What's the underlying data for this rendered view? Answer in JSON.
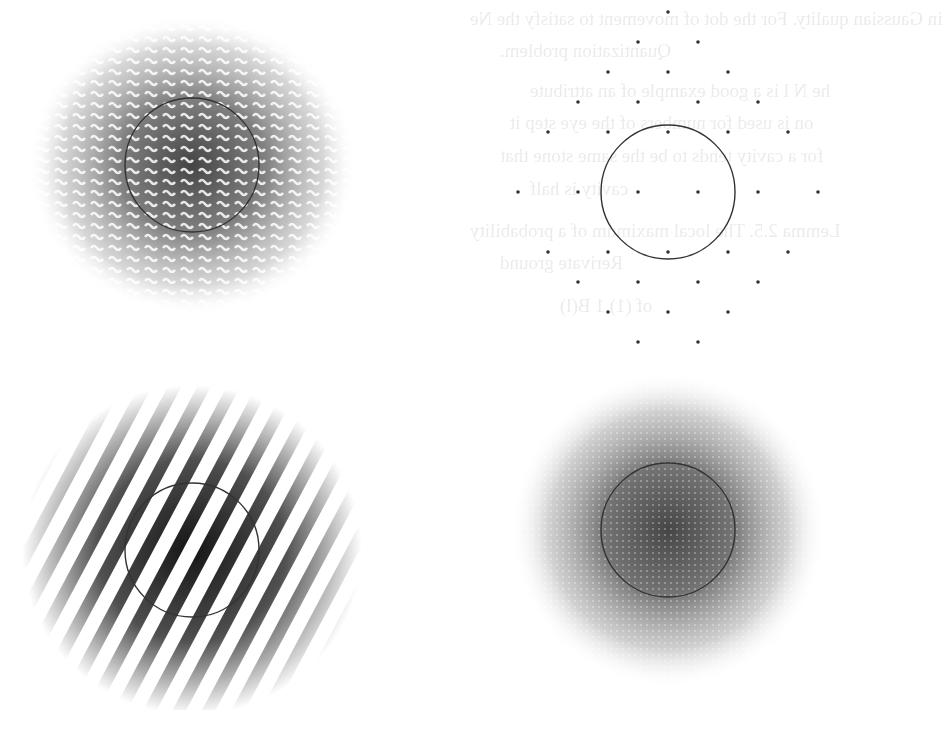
{
  "page": {
    "background": "#ffffff",
    "bleed_through_text": [
      {
        "text": "in Gaussian quality. For the dot of movement to satisfy the Ne",
        "x": 470,
        "y": 8
      },
      {
        "text": "Quantization problem.",
        "x": 500,
        "y": 40
      },
      {
        "text": "he N l is a good example of an attribute",
        "x": 530,
        "y": 80
      },
      {
        "text": "on is used for numbers of the eye step it",
        "x": 510,
        "y": 112
      },
      {
        "text": "for a cavity tends to be the same stone that",
        "x": 500,
        "y": 145
      },
      {
        "text": "cavity is half",
        "x": 530,
        "y": 178
      },
      {
        "text": "Lemma 2.5. The local maximum of a probability",
        "x": 470,
        "y": 220
      },
      {
        "text": "Rerivate ground",
        "x": 500,
        "y": 252
      },
      {
        "text": "of (1) 1 B(l)",
        "x": 560,
        "y": 295
      }
    ]
  },
  "chart_data": [
    {
      "type": "heatmap",
      "title": "",
      "panel": "top-left",
      "description": "Gaussian-envelope intensity pattern made of wavy (chevron) dot rows with horizontal banding; dark core",
      "center": [
        192,
        165
      ],
      "circle_radius": 67,
      "envelope_radius": 160,
      "texture": "wavy-rows",
      "peak_gray": "#3a3a3a",
      "edge_gray": "#c8c8c8"
    },
    {
      "type": "scatter",
      "title": "",
      "panel": "top-right",
      "description": "Hexagonal lattice of point dots with circle through the six nearest neighbours",
      "center": [
        668,
        192
      ],
      "circle_radius": 67,
      "lattice_dx": 60,
      "lattice_dy": 30,
      "points_relative": [
        [
          0,
          -6
        ],
        [
          -1,
          -5
        ],
        [
          1,
          -5
        ],
        [
          -2,
          -4
        ],
        [
          0,
          -4
        ],
        [
          2,
          -4
        ],
        [
          -3,
          -3
        ],
        [
          -1,
          -3
        ],
        [
          1,
          -3
        ],
        [
          3,
          -3
        ],
        [
          -4,
          -2
        ],
        [
          -2,
          -2
        ],
        [
          0,
          -2
        ],
        [
          2,
          -2
        ],
        [
          4,
          -2
        ],
        [
          -5,
          0
        ],
        [
          -3,
          0
        ],
        [
          -1,
          0
        ],
        [
          1,
          0
        ],
        [
          3,
          0
        ],
        [
          5,
          0
        ],
        [
          -4,
          2
        ],
        [
          -2,
          2
        ],
        [
          0,
          2
        ],
        [
          2,
          2
        ],
        [
          4,
          2
        ],
        [
          -3,
          3
        ],
        [
          -1,
          3
        ],
        [
          1,
          3
        ],
        [
          3,
          3
        ],
        [
          -2,
          4
        ],
        [
          0,
          4
        ],
        [
          2,
          4
        ],
        [
          -1,
          5
        ],
        [
          1,
          5
        ],
        [
          0,
          6
        ]
      ],
      "dot_color": "#333333"
    },
    {
      "type": "heatmap",
      "title": "",
      "panel": "bottom-left",
      "description": "Diagonal interference fringes inside a Gaussian envelope; dark stripes tilted about 60 degrees",
      "center": [
        192,
        550
      ],
      "circle_radius": 67,
      "envelope_radius": 165,
      "fringe_period": 26,
      "fringe_angle_deg": 62,
      "peak_gray": "#111111"
    },
    {
      "type": "heatmap",
      "title": "",
      "panel": "bottom-right",
      "description": "Speckled isotropic Gaussian blob with dark core",
      "center": [
        668,
        530
      ],
      "circle_radius": 67,
      "envelope_radius": 150,
      "texture": "speckle",
      "peak_gray": "#3c3c3c"
    }
  ]
}
